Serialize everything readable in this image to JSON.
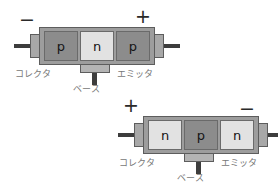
{
  "figure": {
    "background_color": "#ffffff",
    "caption_color": "#777777",
    "sign_color": "#2a2a2a",
    "dark_region_color": "#8c8c8c",
    "light_region_color": "#e2e2e2",
    "case_color": "#9d9d9d",
    "lead_color": "#3d3d3d"
  },
  "transistors": [
    {
      "id": "pnp",
      "type": "PNP",
      "regions": [
        {
          "label": "p",
          "shade": "dark"
        },
        {
          "label": "n",
          "shade": "light"
        },
        {
          "label": "p",
          "shade": "dark"
        }
      ],
      "left_sign": "−",
      "right_sign": "+",
      "collector_label": "コレクタ",
      "base_label": "ベース",
      "emitter_label": "エミッタ"
    },
    {
      "id": "npn",
      "type": "NPN",
      "regions": [
        {
          "label": "n",
          "shade": "light"
        },
        {
          "label": "p",
          "shade": "dark"
        },
        {
          "label": "n",
          "shade": "light"
        }
      ],
      "left_sign": "+",
      "right_sign": "−",
      "collector_label": "コレクタ",
      "base_label": "ベース",
      "emitter_label": "エミッタ"
    }
  ]
}
